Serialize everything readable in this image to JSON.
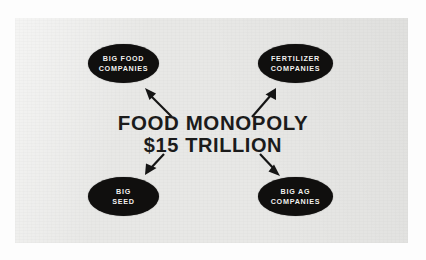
{
  "diagram": {
    "center": {
      "line1": "FOOD MONOPOLY",
      "line2": "$15 TRILLION"
    },
    "nodes": [
      {
        "id": "big-food-companies",
        "label": "Big Food Companies",
        "line1": "Big Food",
        "line2": "Companies",
        "position": "top-left"
      },
      {
        "id": "fertilizer-companies",
        "label": "Fertilizer Companies",
        "line1": "Fertilizer",
        "line2": "Companies",
        "position": "top-right"
      },
      {
        "id": "big-seed",
        "label": "Big Seed",
        "line1": "Big",
        "line2": "Seed",
        "position": "bottom-left"
      },
      {
        "id": "big-ag-companies",
        "label": "Big Ag Companies",
        "line1": "Big Ag",
        "line2": "Companies",
        "position": "bottom-right"
      }
    ],
    "arrows": [
      {
        "id": "arrow-to-big-food",
        "from": "center",
        "to": "big-food-companies",
        "direction": "up-left"
      },
      {
        "id": "arrow-to-fertilizer",
        "from": "center",
        "to": "fertilizer-companies",
        "direction": "up-right"
      },
      {
        "id": "arrow-to-big-seed",
        "from": "center",
        "to": "big-seed",
        "direction": "down-left"
      },
      {
        "id": "arrow-to-big-ag",
        "from": "center",
        "to": "big-ag-companies",
        "direction": "down-right"
      }
    ],
    "colors": {
      "node_fill": "#100f0e",
      "node_text": "#f2f1ee",
      "center_text": "#1b1b1b",
      "arrow": "#151515",
      "paper": "#e8e8e6",
      "page": "#ffffff"
    }
  }
}
